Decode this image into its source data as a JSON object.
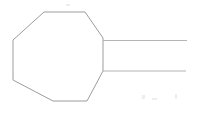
{
  "document": {
    "title": "Octagon with parallel extension lines",
    "background_color": "#ffffff",
    "width": 198,
    "height": 117
  },
  "style": {
    "stroke_color": "#9d9d9d",
    "stroke_color_soft": "#b4b4b4",
    "stroke_width": 1,
    "fill": "none"
  },
  "shapes": [
    {
      "name": "octagon",
      "type": "polygon",
      "closed": true,
      "points": "44,12 85,12 103,38 103,71 87,101 53,101 13,80 13,40",
      "vertices": [
        {
          "label": "top-left",
          "x": 44,
          "y": 12
        },
        {
          "label": "top-right",
          "x": 85,
          "y": 12
        },
        {
          "label": "upper-right",
          "x": 103,
          "y": 38
        },
        {
          "label": "lower-right",
          "x": 103,
          "y": 71
        },
        {
          "label": "bottom-right",
          "x": 87,
          "y": 101
        },
        {
          "label": "bottom-left",
          "x": 53,
          "y": 101
        },
        {
          "label": "lower-left",
          "x": 13,
          "y": 80
        },
        {
          "label": "upper-left",
          "x": 13,
          "y": 40
        }
      ]
    },
    {
      "name": "upper-extension-line",
      "type": "line",
      "x1": 103,
      "y1": 40.5,
      "x2": 187,
      "y2": 40.5
    },
    {
      "name": "lower-extension-line",
      "type": "line",
      "x1": 103,
      "y1": 71.0,
      "x2": 186,
      "y2": 71.0
    }
  ],
  "artifacts": [
    {
      "name": "scan-speck-1",
      "x": 142,
      "y": 95,
      "w": 3,
      "h": 4
    },
    {
      "name": "scan-speck-2",
      "x": 152,
      "y": 98,
      "w": 5,
      "h": 2
    },
    {
      "name": "scan-speck-3",
      "x": 175,
      "y": 94,
      "w": 2,
      "h": 5
    },
    {
      "name": "scan-speck-4",
      "x": 66,
      "y": 4,
      "w": 4,
      "h": 2
    }
  ]
}
